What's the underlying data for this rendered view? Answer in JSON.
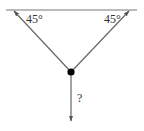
{
  "diagram": {
    "type": "force-diagram",
    "ceiling": {
      "x1": 6,
      "y1": 10,
      "x2": 137,
      "y2": 10
    },
    "node": {
      "cx": 71,
      "cy": 72,
      "r": 3.6
    },
    "left_rope": {
      "angle_label": "45°",
      "angle_deg": 45
    },
    "right_rope": {
      "angle_label": "45°",
      "angle_deg": 45
    },
    "hanging_force": {
      "label": "?"
    },
    "colors": {
      "line": "#777777",
      "node": "#000000",
      "text": "#333333"
    }
  }
}
